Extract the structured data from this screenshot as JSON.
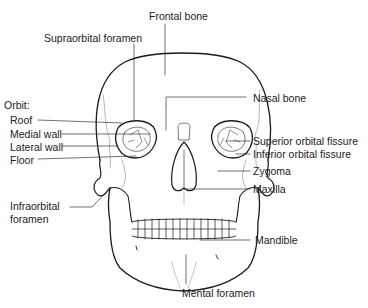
{
  "diagram": {
    "colors": {
      "outline": "#1a1a1a",
      "suture": "#888888",
      "leader": "#333333",
      "text": "#222222",
      "background": "#ffffff"
    },
    "labels": {
      "frontal_bone": "Frontal bone",
      "supraorbital_foramen": "Supraorbital foramen",
      "orbit_heading": "Orbit:",
      "roof": "Roof",
      "medial_wall": "Medial wall",
      "lateral_wall": "Lateral wall",
      "floor": "Floor",
      "infraorbital_foramen_line1": "Infraorbital",
      "infraorbital_foramen_line2": "foramen",
      "nasal_bone": "Nasal bone",
      "superior_orbital_fissure": "Superior orbital fissure",
      "inferior_orbital_fissure": "Inferior orbital fissure",
      "zygoma": "Zygoma",
      "maxilla": "Maxilla",
      "mandible": "Mandible",
      "mental_foramen": "Mental foramen"
    }
  }
}
